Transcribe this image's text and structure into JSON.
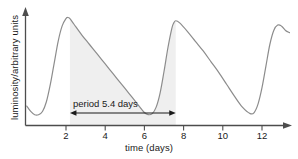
{
  "chart_data": {
    "type": "line",
    "title": "",
    "xlabel": "time (days)",
    "ylabel": "luminosity/arbitrary units",
    "xlim": [
      0,
      13.8
    ],
    "ylim": [
      0,
      1.1
    ],
    "grid": false,
    "legend": null,
    "xticks": [
      2,
      4,
      6,
      8,
      10,
      12
    ],
    "xtick_labels": [
      "2",
      "4",
      "6",
      "8",
      "10",
      "12"
    ],
    "yticks": [],
    "ytick_labels": [],
    "annotations": [
      {
        "name": "period-annotation",
        "text": "period 5.4 days",
        "kind": "double-headed-arrow",
        "x_start": 2.2,
        "x_end": 7.6,
        "y": 0.12
      },
      {
        "name": "period-shading",
        "kind": "shaded-region",
        "x_start": 2.2,
        "x_end": 7.6,
        "color": "#efefef"
      }
    ],
    "series": [
      {
        "name": "luminosity",
        "color": "#8c8c8c",
        "x": [
          0.0,
          0.2,
          0.4,
          0.6,
          0.8,
          1.0,
          1.2,
          1.4,
          1.6,
          1.8,
          2.0,
          2.1,
          2.2,
          2.4,
          2.8,
          3.2,
          3.6,
          4.0,
          4.4,
          4.8,
          5.2,
          5.6,
          6.0,
          6.2,
          6.4,
          6.6,
          6.8,
          7.0,
          7.2,
          7.4,
          7.5,
          7.6,
          7.8,
          8.2,
          8.6,
          9.0,
          9.4,
          9.8,
          10.2,
          10.6,
          11.0,
          11.4,
          11.6,
          11.8,
          12.0,
          12.2,
          12.4,
          12.6,
          12.8,
          13.0,
          13.2,
          13.4
        ],
        "y": [
          0.18,
          0.13,
          0.1,
          0.1,
          0.13,
          0.22,
          0.38,
          0.58,
          0.78,
          0.92,
          0.99,
          1.0,
          0.99,
          0.94,
          0.84,
          0.75,
          0.66,
          0.57,
          0.48,
          0.39,
          0.3,
          0.21,
          0.12,
          0.1,
          0.11,
          0.17,
          0.3,
          0.5,
          0.72,
          0.9,
          0.95,
          0.97,
          0.95,
          0.87,
          0.78,
          0.69,
          0.59,
          0.49,
          0.38,
          0.27,
          0.17,
          0.11,
          0.12,
          0.2,
          0.35,
          0.55,
          0.75,
          0.88,
          0.93,
          0.92,
          0.88,
          0.86
        ]
      }
    ]
  },
  "axes": {
    "x_title": "time (days)",
    "y_title": "luminosity/arbitrary units"
  },
  "colors": {
    "curve": "#8c8c8c",
    "axis": "#4d4d4d",
    "shade": "#efefef",
    "text": "#1a1a1a"
  }
}
